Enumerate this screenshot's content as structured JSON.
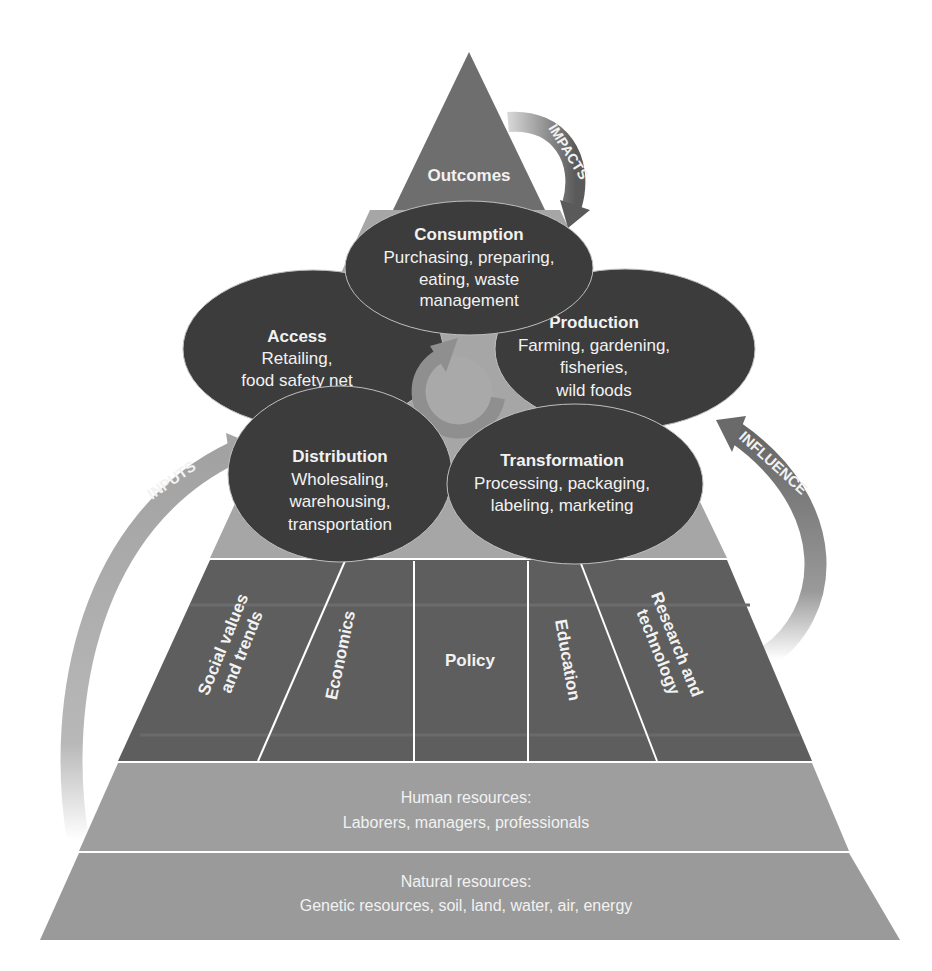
{
  "diagram": {
    "apex": {
      "label": "Outcomes"
    },
    "cycle": [
      {
        "title": "Consumption",
        "lines": [
          "Purchasing, preparing,",
          "eating, waste",
          "management"
        ]
      },
      {
        "title": "Access",
        "lines": [
          "Retailing,",
          "food safety net"
        ]
      },
      {
        "title": "Production",
        "lines": [
          "Farming, gardening,",
          "fisheries,",
          "wild foods"
        ]
      },
      {
        "title": "Distribution",
        "lines": [
          "Wholesaling,",
          "warehousing,",
          "transportation"
        ]
      },
      {
        "title": "Transformation",
        "lines": [
          "Processing, packaging,",
          "labeling, marketing"
        ]
      }
    ],
    "drivers": [
      {
        "lines": [
          "Social values",
          "and trends"
        ]
      },
      {
        "lines": [
          "Economics"
        ]
      },
      {
        "lines": [
          "Policy"
        ]
      },
      {
        "lines": [
          "Education"
        ]
      },
      {
        "lines": [
          "Research and",
          "technology"
        ]
      }
    ],
    "human_resources": {
      "title": "Human resources:",
      "detail": "Laborers, managers, professionals"
    },
    "natural_resources": {
      "title": "Natural resources:",
      "detail": "Genetic resources, soil, land, water, air, energy"
    },
    "arrows": {
      "impacts": "IMPACTS",
      "inputs": "INPUTS",
      "influence": "INFLUENCE"
    },
    "colors": {
      "apex": "#6e6e6e",
      "ellipse": "#3c3c3c",
      "drivers": "#5e5e5e",
      "mid_band": "#a6a6a6",
      "resources": "#9a9a9a",
      "inputs_arrow": "#a4a4a4",
      "influence_arrow": "#6a6a6a",
      "cycle_arrow": "#9b9b9b"
    }
  }
}
